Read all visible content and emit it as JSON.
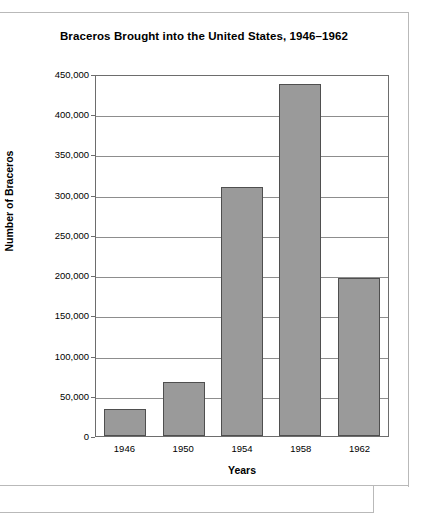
{
  "chart_data": {
    "type": "bar",
    "title": "Braceros Brought into the United States, 1946–1962",
    "xlabel": "Years",
    "ylabel": "Number of Braceros",
    "categories": [
      "1946",
      "1950",
      "1954",
      "1958",
      "1962"
    ],
    "values": [
      33000,
      67000,
      310000,
      438000,
      196000
    ],
    "ylim": [
      0,
      450000
    ],
    "ytick_values": [
      0,
      50000,
      100000,
      150000,
      200000,
      250000,
      300000,
      350000,
      400000,
      450000
    ],
    "ytick_labels": [
      "0",
      "50,000",
      "100,000",
      "150,000",
      "200,000",
      "250,000",
      "300,000",
      "350,000",
      "400,000",
      "450,000"
    ],
    "grid": true,
    "legend": false,
    "colors": {
      "bar_fill": "#9a9a9a",
      "bar_stroke": "#4f4f4f",
      "gridline": "#8d8d8d",
      "axis": "#6d6d6d",
      "text": "#000000",
      "background": "#ffffff"
    }
  }
}
